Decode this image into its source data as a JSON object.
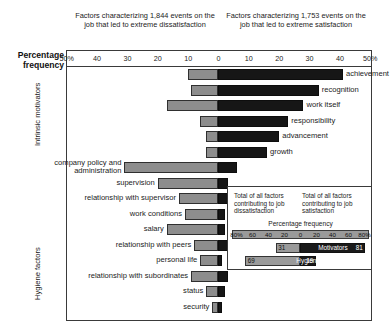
{
  "header": {
    "caption_left": "Factors characterizing 1,844 events on the job that led to extreme dissatisfaction",
    "caption_right": "Factors characterizing 1,753 events on the job that led to extreme satisfaction"
  },
  "axis": {
    "title": "Percentage frequency",
    "ticks": [
      "50%",
      "40",
      "30",
      "20",
      "10",
      "0",
      "10",
      "20",
      "30",
      "40",
      "50%"
    ]
  },
  "groups": {
    "motivators": "Intrinsic motivators",
    "hygiene": "Hygiene factors"
  },
  "legend": {
    "head_left": "Total of all factors contributing to job dissatisfaction",
    "head_right": "Total of all factors contributing to job satisfaction",
    "scale_title": "Percentage frequency",
    "scale_ticks": [
      "80%",
      "60",
      "40",
      "20",
      "0",
      "20",
      "40",
      "60",
      "80%"
    ],
    "rows": [
      {
        "name": "Motivators",
        "left": 31,
        "right": 81,
        "left_label": "31",
        "right_label": "81"
      },
      {
        "name": "Hygiene",
        "left": 69,
        "right": 19,
        "left_label": "69",
        "right_label": "19"
      }
    ]
  },
  "chart_data": {
    "type": "bar",
    "xlabel": "Percentage frequency",
    "ylabel": "",
    "xlim": [
      -50,
      50
    ],
    "grid": false,
    "orientation": "horizontal-diverging",
    "categories": [
      "achievement",
      "recognition",
      "work itself",
      "responsibility",
      "advancement",
      "growth",
      "company policy and administration",
      "supervision",
      "relationship with supervisor",
      "work conditions",
      "salary",
      "relationship with peers",
      "personal life",
      "relationship with subordinates",
      "status",
      "security"
    ],
    "series": [
      {
        "name": "dissatisfaction",
        "color": "#8d8d8d",
        "values": [
          10,
          9,
          17,
          6,
          4,
          4,
          31,
          20,
          13,
          11,
          17,
          8,
          6,
          9,
          4,
          2
        ]
      },
      {
        "name": "satisfaction",
        "color": "#161616",
        "values": [
          41,
          33,
          28,
          23,
          20,
          16,
          6,
          3,
          3,
          2,
          2,
          3,
          1,
          3,
          2,
          1
        ]
      }
    ],
    "groups": [
      {
        "label": "Intrinsic motivators",
        "categories": [
          0,
          1,
          2,
          3,
          4,
          5
        ]
      },
      {
        "label": "Hygiene factors",
        "categories": [
          6,
          7,
          8,
          9,
          10,
          11,
          12,
          13,
          14,
          15
        ]
      }
    ]
  },
  "bars": [
    {
      "label": "achievement",
      "left": 10,
      "right": 41,
      "side": "right"
    },
    {
      "label": "recognition",
      "left": 9,
      "right": 33,
      "side": "right"
    },
    {
      "label": "work itself",
      "left": 17,
      "right": 28,
      "side": "right"
    },
    {
      "label": "responsibility",
      "left": 6,
      "right": 23,
      "side": "right"
    },
    {
      "label": "advancement",
      "left": 4,
      "right": 20,
      "side": "right"
    },
    {
      "label": "growth",
      "left": 4,
      "right": 16,
      "side": "right"
    },
    {
      "label": "company policy and administration",
      "left": 31,
      "right": 6,
      "side": "left"
    },
    {
      "label": "supervision",
      "left": 20,
      "right": 3,
      "side": "left"
    },
    {
      "label": "relationship with supervisor",
      "left": 13,
      "right": 3,
      "side": "left"
    },
    {
      "label": "work conditions",
      "left": 11,
      "right": 2,
      "side": "left"
    },
    {
      "label": "salary",
      "left": 17,
      "right": 2,
      "side": "left"
    },
    {
      "label": "relationship with peers",
      "left": 8,
      "right": 3,
      "side": "left"
    },
    {
      "label": "personal life",
      "left": 6,
      "right": 1,
      "side": "left"
    },
    {
      "label": "relationship with subordinates",
      "left": 9,
      "right": 3,
      "side": "left"
    },
    {
      "label": "status",
      "left": 4,
      "right": 2,
      "side": "left"
    },
    {
      "label": "security",
      "left": 2,
      "right": 1,
      "side": "left"
    }
  ]
}
